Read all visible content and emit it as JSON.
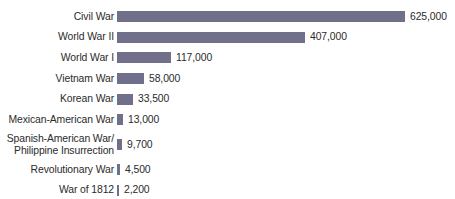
{
  "chart_data": {
    "type": "bar",
    "orientation": "horizontal",
    "title": "",
    "subtitle": "",
    "xlabel": "",
    "ylabel": "",
    "grid": false,
    "legend": false,
    "axis_visible": false,
    "value_labels_shown": true,
    "xlim": [
      0,
      625000
    ],
    "bar_color": "#70708a",
    "text_color": "#2b2b2b",
    "background_color": "#ffffff",
    "categories": [
      "Civil War",
      "World War II",
      "World War I",
      "Vietnam War",
      "Korean War",
      "Mexican-American War",
      "Spanish-American War/\nPhilippine Insurrection",
      "Revolutionary War",
      "War of 1812"
    ],
    "values": [
      625000,
      407000,
      117000,
      58000,
      33500,
      13000,
      9700,
      4500,
      2200
    ],
    "value_labels": [
      "625,000",
      "407,000",
      "117,000",
      "58,000",
      "33,500",
      "13,000",
      "9,700",
      "4,500",
      "2,200"
    ],
    "bars": [
      {
        "label": "Civil War",
        "value": 625000,
        "value_label": "625,000",
        "bar_px": 288
      },
      {
        "label": "World War II",
        "value": 407000,
        "value_label": "407,000",
        "bar_px": 188
      },
      {
        "label": "World War I",
        "value": 117000,
        "value_label": "117,000",
        "bar_px": 54
      },
      {
        "label": "Vietnam War",
        "value": 58000,
        "value_label": "58,000",
        "bar_px": 27
      },
      {
        "label": "Korean War",
        "value": 33500,
        "value_label": "33,500",
        "bar_px": 16
      },
      {
        "label": "Mexican-American War",
        "value": 13000,
        "value_label": "13,000",
        "bar_px": 6
      },
      {
        "label": "Spanish-American War/\nPhilippine Insurrection",
        "value": 9700,
        "value_label": "9,700",
        "bar_px": 5
      },
      {
        "label": "Revolutionary War",
        "value": 4500,
        "value_label": "4,500",
        "bar_px": 3
      },
      {
        "label": "War of 1812",
        "value": 2200,
        "value_label": "2,200",
        "bar_px": 2
      }
    ]
  }
}
